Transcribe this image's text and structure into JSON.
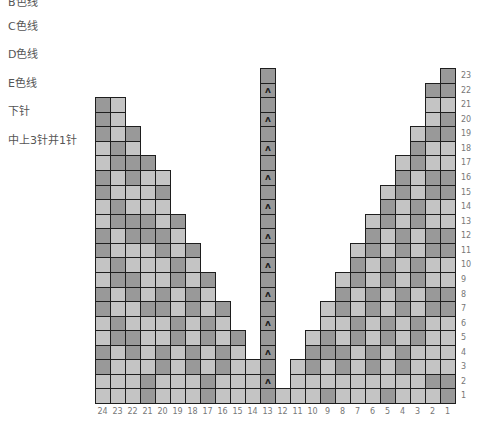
{
  "legend": [
    {
      "label": "B色线",
      "top": -7
    },
    {
      "label": "C色线",
      "top": 17
    },
    {
      "label": "D色线",
      "top": 45
    },
    {
      "label": "E色线",
      "top": 74
    },
    {
      "label": "下针",
      "top": 102
    },
    {
      "label": "中上3针并1针",
      "top": 131
    }
  ],
  "chart": {
    "columns_total": 24,
    "rows_total": 23,
    "column_labels": [
      "24",
      "23",
      "22",
      "21",
      "20",
      "19",
      "18",
      "17",
      "16",
      "15",
      "14",
      "13",
      "12",
      "11",
      "10",
      "9",
      "8",
      "7",
      "6",
      "5",
      "4",
      "3",
      "2",
      "1"
    ],
    "row_labels": [
      "1",
      "2",
      "3",
      "4",
      "5",
      "6",
      "7",
      "8",
      "9",
      "10",
      "11",
      "12",
      "13",
      "14",
      "15",
      "16",
      "17",
      "18",
      "19",
      "20",
      "21",
      "22",
      "23"
    ],
    "colors": {
      "light": "#c4c4c4",
      "dark": "#999999",
      "border": "#1e1e1e"
    },
    "decrease_symbol": "ʌ",
    "columns": [
      {
        "num": 24,
        "cells": "LLDDLLDDLLDDLLDDLLDDD"
      },
      {
        "num": 23,
        "cells": "LLLLDDLLDDLLDDLLDDLLL"
      },
      {
        "num": 22,
        "cells": "LLLDDLLDDLLDDLLDDLD"
      },
      {
        "num": 21,
        "cells": "DDLLLLDLLLLDDLLLD"
      },
      {
        "num": 20,
        "cells": "LLDDLLDDLLDDLLDL"
      },
      {
        "num": 19,
        "cells": "LLLLDDLLDDLLD"
      },
      {
        "num": 18,
        "cells": "LLDDLLDDLLD"
      },
      {
        "num": 17,
        "cells": "DDLLDDLLD"
      },
      {
        "num": 16,
        "cells": "LLDDLLD"
      },
      {
        "num": 15,
        "cells": "LLLLD"
      },
      {
        "num": 14,
        "cells": "LLL"
      },
      {
        "num": 13,
        "cells": "DDDDDDDDDDDDDDDDDDDDDDD",
        "center": true
      },
      {
        "num": 12,
        "cells": "L"
      },
      {
        "num": 11,
        "cells": "LLL"
      },
      {
        "num": 10,
        "cells": "LLDDL"
      },
      {
        "num": 9,
        "cells": "DLLDDLL"
      },
      {
        "num": 8,
        "cells": "LLDDLLDDL"
      },
      {
        "num": 7,
        "cells": "LLLLDDLLDDL"
      },
      {
        "num": 6,
        "cells": "LLDDLLDDLLDDL"
      },
      {
        "num": 5,
        "cells": "DLLLDDLLDDLLDDL"
      },
      {
        "num": 4,
        "cells": "LLDDLLDDLLDDLLDDL"
      },
      {
        "num": 3,
        "cells": "LLLLDDLLDDLLDDLLDDL"
      },
      {
        "num": 2,
        "cells": "LDLLLLDDLLDDLLDDLLDLLD"
      },
      {
        "num": 1,
        "cells": "DDLLLLDDLLDDLLDDLLDDLDD"
      }
    ],
    "grid": {
      "left": 95,
      "bottom": 403,
      "cell_w": 15,
      "cell_h": 14.56
    }
  }
}
